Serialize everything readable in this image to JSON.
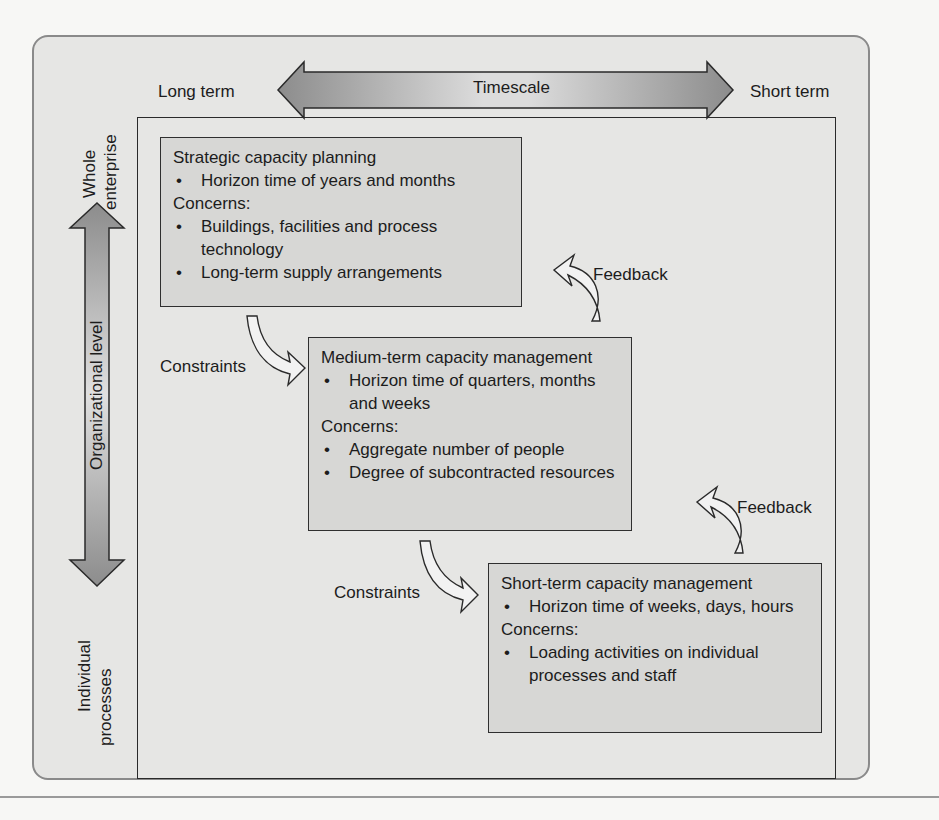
{
  "figure": {
    "timescale_axis": {
      "label": "Timescale",
      "left_label": "Long term",
      "right_label": "Short term"
    },
    "organizational_axis": {
      "label": "Organizational level",
      "top_label_line1": "Whole",
      "top_label_line2": "enterprise",
      "bottom_label_line1": "Individual",
      "bottom_label_line2": "processes"
    },
    "boxes": [
      {
        "title": "Strategic capacity planning",
        "horizon": [
          "Horizon time of years and months"
        ],
        "concerns_label": "Concerns:",
        "concerns": [
          "Buildings, facilities and process technology",
          "Long-term supply arrangements"
        ]
      },
      {
        "title": "Medium-term capacity management",
        "horizon": [
          "Horizon time of quarters, months and weeks"
        ],
        "concerns_label": "Concerns:",
        "concerns": [
          "Aggregate number of people",
          "Degree of subcontracted resources"
        ]
      },
      {
        "title": "Short-term capacity management",
        "horizon": [
          "Horizon time of weeks, days, hours"
        ],
        "concerns_label": "Concerns:",
        "concerns": [
          "Loading activities on individual processes and staff"
        ]
      }
    ],
    "connectors": {
      "constraints_1": "Constraints",
      "constraints_2": "Constraints",
      "feedback_1": "Feedback",
      "feedback_2": "Feedback"
    },
    "colors": {
      "panel_bg": "#e6e6e4",
      "box_bg": "#d7d7d5",
      "arrow_light": "#e2e2e2",
      "arrow_dark": "#8a8a8a",
      "line": "#2a2a2a"
    }
  }
}
